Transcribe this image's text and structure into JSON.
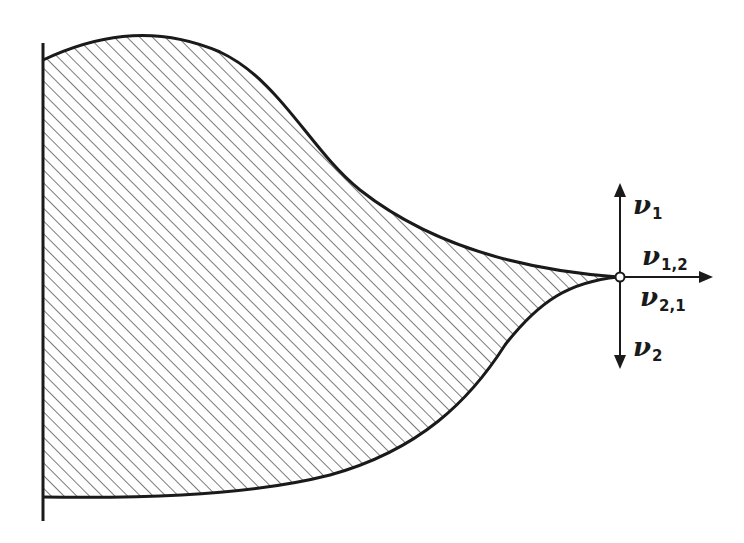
{
  "diagram": {
    "colors": {
      "stroke": "#1a1a1a",
      "hatch": "#333333",
      "background": "#ffffff",
      "node_fill": "#ffffff"
    },
    "region": {
      "fill_pattern": "diagonal-hatch"
    },
    "node": {
      "name": "convergence-point",
      "x": 620,
      "y": 277
    },
    "labels": {
      "nu1": {
        "symbol": "ν",
        "subscript": "1"
      },
      "nu12": {
        "symbol": "ν",
        "subscript": "1,2"
      },
      "nu21": {
        "symbol": "ν",
        "subscript": "2,1"
      },
      "nu2": {
        "symbol": "ν",
        "subscript": "2"
      }
    },
    "arrows": [
      {
        "name": "arrow-up",
        "direction": "up",
        "label": "ν1"
      },
      {
        "name": "arrow-right",
        "direction": "right",
        "label": "ν1,2 / ν2,1"
      },
      {
        "name": "arrow-down",
        "direction": "down",
        "label": "ν2"
      }
    ]
  }
}
